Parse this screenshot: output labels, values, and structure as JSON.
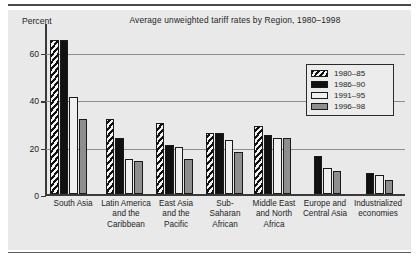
{
  "figure": {
    "title": "Average unweighted tariff rates by Region, 1980–1998",
    "y_axis_unit": "Percent"
  },
  "legend": {
    "items": [
      {
        "label": "1980–85",
        "swatch": "diagonal-hatch-swatch",
        "color": "#111111"
      },
      {
        "label": "1986–90",
        "swatch": "solid-black-swatch",
        "color": "#111111"
      },
      {
        "label": "1991–95",
        "swatch": "white-swatch",
        "color": "#f0f0f0"
      },
      {
        "label": "1996–98",
        "swatch": "gray-swatch",
        "color": "#8e8e8e"
      }
    ]
  },
  "y_ticks": [
    {
      "label": "60",
      "value": 60
    },
    {
      "label": "40",
      "value": 40
    },
    {
      "label": "20",
      "value": 20
    },
    {
      "label": "0",
      "value": 0
    }
  ],
  "chart_data": {
    "type": "bar",
    "title": "Average unweighted tariff rates by Region, 1980–1998",
    "xlabel": "",
    "ylabel": "Percent",
    "ylim": [
      0,
      70
    ],
    "yticks": [
      0,
      20,
      40,
      60
    ],
    "grid": true,
    "legend_position": "upper-right",
    "categories": [
      "South Asia",
      "Latin America and the Caribbean",
      "East Asia and the Pacific",
      "Sub-Saharan African",
      "Middle East and North Africa",
      "Europe and Central Asia",
      "Industrialized economies"
    ],
    "series": [
      {
        "name": "1980–85",
        "values": [
          65,
          32,
          30,
          26,
          29,
          null,
          null
        ]
      },
      {
        "name": "1986–90",
        "values": [
          65,
          24,
          21,
          26,
          25,
          16,
          9
        ]
      },
      {
        "name": "1991–95",
        "values": [
          41,
          15,
          20,
          23,
          24,
          11,
          8
        ]
      },
      {
        "name": "1996–98",
        "values": [
          32,
          14,
          15,
          18,
          24,
          10,
          6
        ]
      }
    ]
  }
}
